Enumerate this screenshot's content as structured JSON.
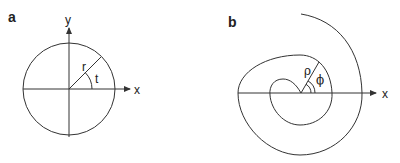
{
  "panels": [
    {
      "label": "a",
      "axes": {
        "x_label": "x",
        "y_label": "y"
      },
      "radius_label": "r",
      "angle_label": "t",
      "shape": "circle"
    },
    {
      "label": "b",
      "axes": {
        "x_label": "x"
      },
      "radius_label": "ρ",
      "angle_label": "ϕ",
      "shape": "spiral"
    }
  ],
  "colors": {
    "stroke": "#333333",
    "background": "#ffffff"
  }
}
